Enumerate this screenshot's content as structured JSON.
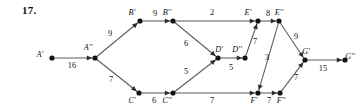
{
  "figure": {
    "problem_number": "17.",
    "nodes": [
      {
        "id": "Ap",
        "label": "A'",
        "x": 52,
        "y": 58,
        "label_dx": -12,
        "label_dy": -1
      },
      {
        "id": "App",
        "label": "A''",
        "x": 95,
        "y": 58,
        "label_dx": -7,
        "label_dy": -8
      },
      {
        "id": "Bp",
        "label": "B'",
        "x": 140,
        "y": 21,
        "label_dx": -8,
        "label_dy": -6
      },
      {
        "id": "Bpp",
        "label": "B''",
        "x": 173,
        "y": 21,
        "label_dx": -6,
        "label_dy": -6
      },
      {
        "id": "Cp",
        "label": "C'",
        "x": 139,
        "y": 93,
        "label_dx": -7,
        "label_dy": 10
      },
      {
        "id": "Cpp",
        "label": "C''",
        "x": 173,
        "y": 93,
        "label_dx": -6,
        "label_dy": 10
      },
      {
        "id": "Dp",
        "label": "D'",
        "x": 218,
        "y": 58,
        "label_dx": 1,
        "label_dy": -6
      },
      {
        "id": "Dpp",
        "label": "D''",
        "x": 245,
        "y": 58,
        "label_dx": -8,
        "label_dy": -6
      },
      {
        "id": "Ep",
        "label": "E'",
        "x": 258,
        "y": 21,
        "label_dx": -10,
        "label_dy": -6
      },
      {
        "id": "Epp",
        "label": "E''",
        "x": 279,
        "y": 21,
        "label_dx": 0,
        "label_dy": -6
      },
      {
        "id": "Fp",
        "label": "F'",
        "x": 258,
        "y": 93,
        "label_dx": -4,
        "label_dy": 10
      },
      {
        "id": "Fpp",
        "label": "F''",
        "x": 280,
        "y": 93,
        "label_dx": 1,
        "label_dy": 10
      },
      {
        "id": "Gp",
        "label": "G'",
        "x": 305,
        "y": 60,
        "label_dx": 1,
        "label_dy": -6
      },
      {
        "id": "Gpp",
        "label": "G''",
        "x": 345,
        "y": 60,
        "label_dx": 5,
        "label_dy": -1
      }
    ],
    "edges": [
      {
        "from": "Ap",
        "to": "App",
        "weight": "16",
        "wx": 72,
        "wy": 68
      },
      {
        "from": "App",
        "to": "Bp",
        "weight": "9",
        "wx": 110,
        "wy": 36
      },
      {
        "from": "App",
        "to": "Cp",
        "weight": "7",
        "wx": 111,
        "wy": 82
      },
      {
        "from": "Bp",
        "to": "Bpp",
        "weight": "9",
        "wx": 155,
        "wy": 16
      },
      {
        "from": "Bpp",
        "to": "Ep",
        "weight": "2",
        "wx": 212,
        "wy": 15
      },
      {
        "from": "Bpp",
        "to": "Dp",
        "weight": "6",
        "wx": 186,
        "wy": 46
      },
      {
        "from": "Cp",
        "to": "Cpp",
        "weight": "6",
        "wx": 154,
        "wy": 103
      },
      {
        "from": "Cpp",
        "to": "Dp",
        "weight": "5",
        "wx": 186,
        "wy": 74
      },
      {
        "from": "Cpp",
        "to": "Fp",
        "weight": "7",
        "wx": 212,
        "wy": 103
      },
      {
        "from": "Dp",
        "to": "Dpp",
        "weight": "5",
        "wx": 231,
        "wy": 70
      },
      {
        "from": "Dpp",
        "to": "Ep",
        "weight": "7",
        "wx": 255,
        "wy": 44
      },
      {
        "from": "Ep",
        "to": "Epp",
        "weight": "8",
        "wx": 268,
        "wy": 16
      },
      {
        "from": "Epp",
        "to": "Fp",
        "weight": "3",
        "wx": 267,
        "wy": 60
      },
      {
        "from": "Epp",
        "to": "Gp",
        "weight": "9",
        "wx": 296,
        "wy": 39
      },
      {
        "from": "Fp",
        "to": "Fpp",
        "weight": "7",
        "wx": 269,
        "wy": 103
      },
      {
        "from": "Fpp",
        "to": "Gp",
        "weight": "7",
        "wx": 296,
        "wy": 80
      },
      {
        "from": "Gp",
        "to": "Gpp",
        "weight": "15",
        "wx": 323,
        "wy": 71
      }
    ]
  }
}
